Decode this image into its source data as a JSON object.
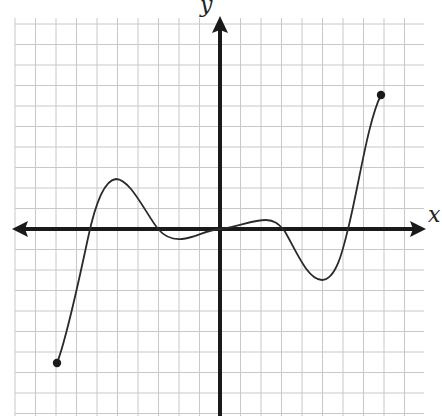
{
  "figure": {
    "type": "function-graph-on-grid",
    "x_axis_label": "x",
    "y_axis_label": "y",
    "grid": {
      "spacing_px": 20.5,
      "origin_px": [
        220,
        229
      ],
      "x_range": [
        -10,
        10
      ],
      "y_range": [
        -9,
        10
      ],
      "color": "#c8c8c8"
    },
    "axis_color": "#1a1a1a",
    "curve_color": "#2a2a2a",
    "endpoints": [
      {
        "label": "left-endpoint",
        "x": -7.9,
        "y": -6.5,
        "closed": true
      },
      {
        "label": "right-endpoint",
        "x": 7.9,
        "y": 6.5,
        "closed": true
      }
    ],
    "key_points": [
      {
        "x": -7.9,
        "y": -6.5,
        "kind": "endpoint"
      },
      {
        "x": -6.4,
        "y": 0,
        "kind": "x-intercept"
      },
      {
        "x": -5,
        "y": 2.4,
        "kind": "local-max"
      },
      {
        "x": -2.9,
        "y": 0,
        "kind": "x-intercept"
      },
      {
        "x": -2.2,
        "y": -0.4,
        "kind": "local-min"
      },
      {
        "x": 0,
        "y": 0,
        "kind": "x-intercept"
      },
      {
        "x": 2.2,
        "y": 0.4,
        "kind": "local-max"
      },
      {
        "x": 2.9,
        "y": 0,
        "kind": "x-intercept"
      },
      {
        "x": 4.9,
        "y": -2.4,
        "kind": "local-min"
      },
      {
        "x": 6.2,
        "y": 0,
        "kind": "x-intercept"
      },
      {
        "x": 7.9,
        "y": 6.5,
        "kind": "endpoint"
      }
    ]
  }
}
